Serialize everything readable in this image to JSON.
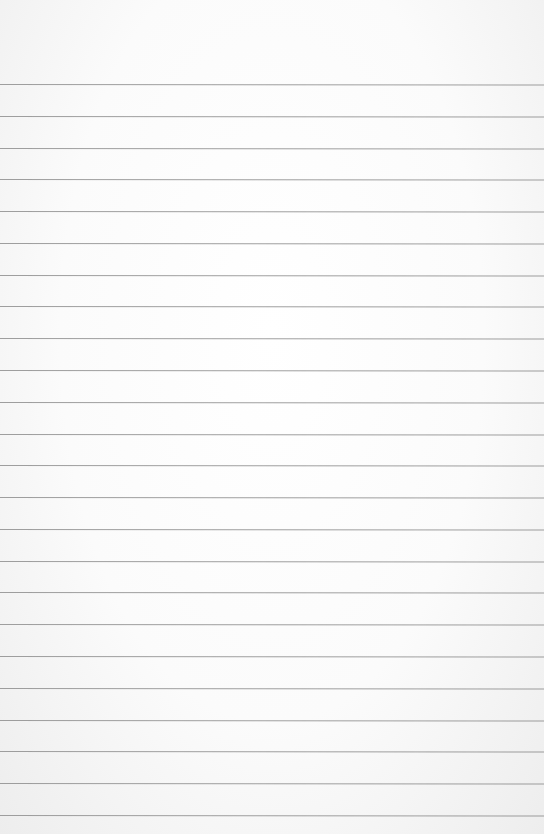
{
  "page": {
    "background_color": "#f9f9f9",
    "line_color": "#8e8e8e",
    "first_line_y": 84,
    "line_spacing": 31.78,
    "line_count": 24
  }
}
